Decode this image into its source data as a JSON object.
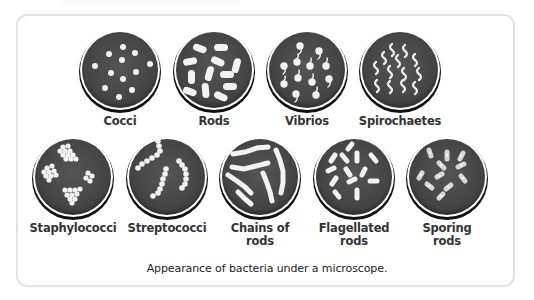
{
  "figure": {
    "caption": "Appearance of bacteria under a microscope.",
    "colors": {
      "dish_fill": "#4a4a4a",
      "dish_rim": "#1a1a1a",
      "bacteria": "#f2f2f2",
      "frame_border": "#e3e3e3",
      "label_text": "#333333"
    },
    "top_row": [
      {
        "id": "cocci",
        "label": "Cocci"
      },
      {
        "id": "rods",
        "label": "Rods"
      },
      {
        "id": "vibrios",
        "label": "Vibrios"
      },
      {
        "id": "spirochaetes",
        "label": "Spirochaetes"
      }
    ],
    "bottom_row": [
      {
        "id": "staphylococci",
        "label": "Staphylococci"
      },
      {
        "id": "streptococci",
        "label": "Streptococci"
      },
      {
        "id": "chains-of-rods",
        "label_line1": "Chains of",
        "label_line2": "rods"
      },
      {
        "id": "flagellated-rods",
        "label_line1": "Flagellated",
        "label_line2": "rods"
      },
      {
        "id": "sporing-rods",
        "label_line1": "Sporing",
        "label_line2": "rods"
      }
    ]
  }
}
